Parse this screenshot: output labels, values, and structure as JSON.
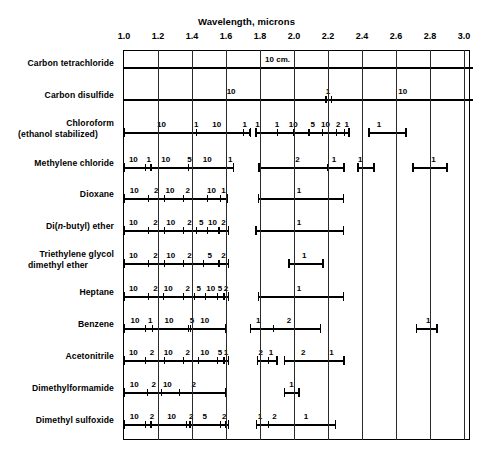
{
  "chart_data": {
    "type": "table",
    "title": "Wavelength, microns",
    "xlabel": "Wavelength, microns",
    "ylabel": "",
    "xlim": [
      1.0,
      3.05
    ],
    "xticks": [
      "1.0",
      "1.2",
      "1.4",
      "1.6",
      "1.8",
      "2.0",
      "2.2",
      "2.4",
      "2.6",
      "2.8",
      "3.0"
    ],
    "xtick_values": [
      1.0,
      1.2,
      1.4,
      1.6,
      1.8,
      2.0,
      2.2,
      2.4,
      2.6,
      2.8,
      3.0
    ],
    "grid": true,
    "legend": "none",
    "annotation": "10 cm.",
    "annotation_x": 1.83,
    "note": "Infrared solvent transmission / cell pathlength chart. Each row is a solvent; horizontal bars mark usable wavelength ranges, numbers give cell path length in mm.",
    "categories": [
      "Carbon tetrachloride",
      "Carbon disulfide",
      "Chloroform (ethanol stabilized)",
      "Methylene chloride",
      "Dioxane",
      "Di(n-butyl) ether",
      "Triethylene glycol dimethyl ether",
      "Heptane",
      "Benzene",
      "Acetonitrile",
      "Dimethylformamide",
      "Dimethyl sulfoxide"
    ],
    "series": [
      {
        "name": "Carbon tetrachloride",
        "label_lines": [
          "Carbon tetrachloride"
        ],
        "full_width": true,
        "bars": [
          {
            "start": 1.0,
            "end": 3.05,
            "labels": [],
            "ticks": []
          }
        ],
        "annotations": [
          {
            "text": "10 cm.",
            "x": 1.83
          }
        ]
      },
      {
        "name": "Carbon disulfide",
        "label_lines": [
          "Carbon disulfide"
        ],
        "full_width": true,
        "bars": [
          {
            "start": 1.0,
            "end": 3.05,
            "labels": [
              {
                "text": "10",
                "x": 1.63
              },
              {
                "text": "1",
                "x": 2.2
              },
              {
                "text": "10",
                "x": 2.64
              }
            ],
            "ticks": [
              2.185,
              2.215
            ]
          }
        ],
        "annotations": []
      },
      {
        "name": "Chloroform (ethanol stabilized)",
        "label_lines": [
          "Chloroform",
          "(ethanol stabilized)"
        ],
        "full_width": false,
        "bars": [
          {
            "start": 1.0,
            "end": 1.745,
            "labels": [
              {
                "text": "10",
                "x": 1.22
              },
              {
                "text": "1",
                "x": 1.425
              },
              {
                "text": "10",
                "x": 1.545
              },
              {
                "text": "1",
                "x": 1.71
              }
            ],
            "ticks": [
              1.425,
              1.7,
              1.735
            ]
          },
          {
            "start": 1.775,
            "end": 2.325,
            "labels": [
              {
                "text": "1",
                "x": 1.785
              },
              {
                "text": "1",
                "x": 1.9
              },
              {
                "text": "10",
                "x": 1.995
              },
              {
                "text": "5",
                "x": 2.11
              },
              {
                "text": "10",
                "x": 2.185
              },
              {
                "text": "2",
                "x": 2.26
              },
              {
                "text": "1",
                "x": 2.31
              }
            ],
            "ticks": [
              1.9,
              1.995,
              2.085,
              2.165,
              2.245,
              2.295
            ]
          },
          {
            "start": 2.44,
            "end": 2.66,
            "labels": [
              {
                "text": "1",
                "x": 2.5
              }
            ],
            "ticks": []
          }
        ],
        "annotations": []
      },
      {
        "name": "Methylene chloride",
        "label_lines": [
          "Methylene chloride"
        ],
        "full_width": false,
        "bars": [
          {
            "start": 1.0,
            "end": 1.645,
            "labels": [
              {
                "text": "10",
                "x": 1.055
              },
              {
                "text": "1",
                "x": 1.145
              },
              {
                "text": "10",
                "x": 1.245
              },
              {
                "text": "5",
                "x": 1.385
              },
              {
                "text": "10",
                "x": 1.49
              },
              {
                "text": "1",
                "x": 1.625
              }
            ],
            "ticks": [
              1.125,
              1.155,
              1.375
            ]
          },
          {
            "start": 1.795,
            "end": 2.295,
            "labels": [
              {
                "text": "2",
                "x": 2.02
              },
              {
                "text": "1",
                "x": 2.235
              }
            ],
            "ticks": [
              2.195
            ]
          },
          {
            "start": 2.375,
            "end": 2.47,
            "labels": [
              {
                "text": "1",
                "x": 2.39
              }
            ],
            "ticks": []
          },
          {
            "start": 2.7,
            "end": 2.9,
            "labels": [
              {
                "text": "1",
                "x": 2.82
              }
            ],
            "ticks": []
          }
        ],
        "annotations": []
      },
      {
        "name": "Dioxane",
        "label_lines": [
          "Dioxane"
        ],
        "full_width": false,
        "bars": [
          {
            "start": 1.0,
            "end": 1.61,
            "labels": [
              {
                "text": "10",
                "x": 1.06
              },
              {
                "text": "2",
                "x": 1.19
              },
              {
                "text": "10",
                "x": 1.27
              },
              {
                "text": "2",
                "x": 1.375
              },
              {
                "text": "10",
                "x": 1.515
              },
              {
                "text": "1",
                "x": 1.585
              }
            ],
            "ticks": [
              1.14,
              1.235,
              1.345,
              1.49,
              1.565
            ]
          },
          {
            "start": 1.79,
            "end": 2.29,
            "labels": [
              {
                "text": "1",
                "x": 2.03
              }
            ],
            "ticks": []
          }
        ],
        "annotations": []
      },
      {
        "name": "Di(n-butyl) ether",
        "label_lines": [
          "Di(n-butyl) ether"
        ],
        "label_html": "Di(<i>n</i>-butyl) ether",
        "full_width": false,
        "bars": [
          {
            "start": 1.0,
            "end": 1.615,
            "labels": [
              {
                "text": "10",
                "x": 1.055
              },
              {
                "text": "2",
                "x": 1.185
              },
              {
                "text": "10",
                "x": 1.275
              },
              {
                "text": "2",
                "x": 1.385
              },
              {
                "text": "5",
                "x": 1.455
              },
              {
                "text": "10",
                "x": 1.52
              },
              {
                "text": "2",
                "x": 1.585
              }
            ],
            "ticks": [
              1.14,
              1.235,
              1.345,
              1.425,
              1.49,
              1.555
            ]
          },
          {
            "start": 1.775,
            "end": 2.29,
            "labels": [
              {
                "text": "1",
                "x": 2.03
              }
            ],
            "ticks": []
          }
        ],
        "annotations": []
      },
      {
        "name": "Triethylene glycol dimethyl ether",
        "label_lines": [
          "Triethylene glycol",
          "dimethyl ether"
        ],
        "full_width": false,
        "bars": [
          {
            "start": 1.0,
            "end": 1.615,
            "labels": [
              {
                "text": "10",
                "x": 1.055
              },
              {
                "text": "2",
                "x": 1.185
              },
              {
                "text": "10",
                "x": 1.275
              },
              {
                "text": "2",
                "x": 1.385
              },
              {
                "text": "5",
                "x": 1.505
              },
              {
                "text": "2",
                "x": 1.585
              }
            ],
            "ticks": [
              1.14,
              1.235,
              1.345,
              1.465,
              1.555
            ]
          },
          {
            "start": 1.97,
            "end": 2.17,
            "labels": [
              {
                "text": "1",
                "x": 2.06
              }
            ],
            "ticks": []
          }
        ],
        "annotations": []
      },
      {
        "name": "Heptane",
        "label_lines": [
          "Heptane"
        ],
        "full_width": false,
        "bars": [
          {
            "start": 1.0,
            "end": 1.615,
            "labels": [
              {
                "text": "10",
                "x": 1.055
              },
              {
                "text": "2",
                "x": 1.185
              },
              {
                "text": "10",
                "x": 1.26
              },
              {
                "text": "2",
                "x": 1.375
              },
              {
                "text": "5",
                "x": 1.44
              },
              {
                "text": "10",
                "x": 1.51
              },
              {
                "text": "5",
                "x": 1.565
              },
              {
                "text": "2",
                "x": 1.6
              }
            ],
            "ticks": [
              1.14,
              1.23,
              1.345,
              1.41,
              1.475,
              1.545,
              1.585
            ]
          },
          {
            "start": 1.79,
            "end": 2.29,
            "labels": [
              {
                "text": "1",
                "x": 2.03
              }
            ],
            "ticks": []
          }
        ],
        "annotations": []
      },
      {
        "name": "Benzene",
        "label_lines": [
          "Benzene"
        ],
        "full_width": false,
        "bars": [
          {
            "start": 1.0,
            "end": 1.6,
            "labels": [
              {
                "text": "10",
                "x": 1.065
              },
              {
                "text": "1",
                "x": 1.155
              },
              {
                "text": "10",
                "x": 1.265
              },
              {
                "text": "5",
                "x": 1.4
              },
              {
                "text": "10",
                "x": 1.475
              }
            ],
            "ticks": [
              1.125,
              1.165,
              1.375,
              1.39
            ]
          },
          {
            "start": 1.745,
            "end": 2.155,
            "labels": [
              {
                "text": "1",
                "x": 1.79
              },
              {
                "text": "2",
                "x": 1.97
              }
            ],
            "ticks": [
              1.875
            ]
          },
          {
            "start": 2.72,
            "end": 2.84,
            "labels": [
              {
                "text": "1",
                "x": 2.79
              }
            ],
            "ticks": []
          }
        ],
        "annotations": []
      },
      {
        "name": "Acetonitrile",
        "label_lines": [
          "Acetonitrile"
        ],
        "full_width": false,
        "bars": [
          {
            "start": 1.0,
            "end": 1.615,
            "labels": [
              {
                "text": "10",
                "x": 1.055
              },
              {
                "text": "2",
                "x": 1.165
              },
              {
                "text": "10",
                "x": 1.26
              },
              {
                "text": "2",
                "x": 1.375
              },
              {
                "text": "10",
                "x": 1.475
              },
              {
                "text": "5",
                "x": 1.565
              },
              {
                "text": "1",
                "x": 1.6
              }
            ],
            "ticks": [
              1.125,
              1.235,
              1.345,
              1.435,
              1.545,
              1.585
            ]
          },
          {
            "start": 1.785,
            "end": 1.9,
            "labels": [
              {
                "text": "2",
                "x": 1.805
              },
              {
                "text": "1",
                "x": 1.865
              }
            ],
            "ticks": [
              1.845
            ]
          },
          {
            "start": 1.945,
            "end": 2.295,
            "labels": [
              {
                "text": "2",
                "x": 2.055
              },
              {
                "text": "1",
                "x": 2.22
              }
            ],
            "ticks": []
          }
        ],
        "annotations": []
      },
      {
        "name": "Dimethylformamide",
        "label_lines": [
          "Dimethylformamide"
        ],
        "full_width": false,
        "bars": [
          {
            "start": 1.0,
            "end": 1.6,
            "labels": [
              {
                "text": "10",
                "x": 1.06
              },
              {
                "text": "2",
                "x": 1.175
              },
              {
                "text": "10",
                "x": 1.255
              },
              {
                "text": "2",
                "x": 1.41
              }
            ],
            "ticks": [
              1.135,
              1.215,
              1.325
            ]
          },
          {
            "start": 1.945,
            "end": 2.03,
            "labels": [
              {
                "text": "1",
                "x": 1.985
              }
            ],
            "ticks": []
          }
        ],
        "annotations": []
      },
      {
        "name": "Dimethyl sulfoxide",
        "label_lines": [
          "Dimethyl sulfoxide"
        ],
        "full_width": false,
        "bars": [
          {
            "start": 1.0,
            "end": 1.615,
            "labels": [
              {
                "text": "10",
                "x": 1.06
              },
              {
                "text": "2",
                "x": 1.165
              },
              {
                "text": "10",
                "x": 1.28
              },
              {
                "text": "2",
                "x": 1.395
              },
              {
                "text": "5",
                "x": 1.475
              },
              {
                "text": "2",
                "x": 1.59
              }
            ],
            "ticks": [
              1.125,
              1.155,
              1.365,
              1.385,
              1.565,
              1.595
            ]
          },
          {
            "start": 1.78,
            "end": 2.245,
            "labels": [
              {
                "text": "1",
                "x": 1.8
              },
              {
                "text": "2",
                "x": 1.885
              },
              {
                "text": "1",
                "x": 2.07
              }
            ],
            "ticks": [
              1.845
            ]
          }
        ],
        "annotations": []
      }
    ]
  }
}
